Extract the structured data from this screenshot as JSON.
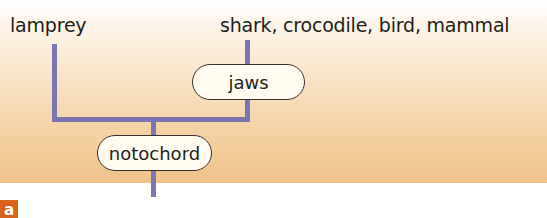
{
  "diagram": {
    "type": "cladogram",
    "taxa": [
      {
        "label": "lamprey"
      },
      {
        "label": "shark, crocodile, bird, mammal"
      }
    ],
    "characters": [
      {
        "label": "jaws"
      },
      {
        "label": "notochord"
      }
    ],
    "panel_label": "a",
    "colors": {
      "branch": "#7b75b2",
      "background_top": "#ffffff",
      "background_bottom": "#efc28a",
      "pill_fill": "#fffbf0",
      "pill_border": "#3a3030",
      "panel_label_bg": "#d9621c",
      "text": "#231f20"
    }
  }
}
